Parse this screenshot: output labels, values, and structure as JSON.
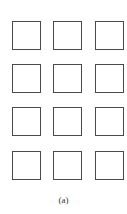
{
  "figure": {
    "caption": "(a)",
    "grid": {
      "rows": 4,
      "cols": 3,
      "stroke_color": "#4a4a4a",
      "fill_color": "#ffffff"
    }
  }
}
